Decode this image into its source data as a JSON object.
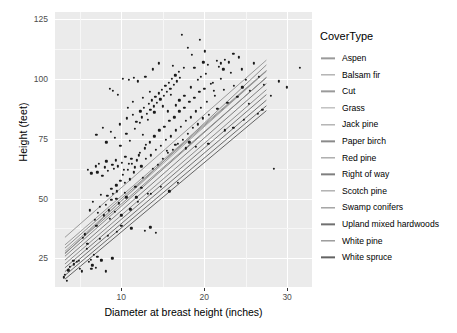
{
  "chart_data": {
    "type": "scatter",
    "title": "",
    "xlabel": "Diameter at breast height (inches)",
    "ylabel": "Height (feet)",
    "xlim": [
      2,
      33
    ],
    "ylim": [
      13,
      128
    ],
    "xticks": [
      10,
      20,
      30
    ],
    "xtick_labels": [
      "10",
      "20",
      "30"
    ],
    "yticks": [
      25,
      50,
      75,
      100,
      125
    ],
    "ytick_labels": [
      "25",
      "50",
      "75",
      "100",
      "125"
    ],
    "grid": true,
    "grid_major_color": "#ffffff",
    "grid_minor_color": "#f7f7f7",
    "panel_background": "#ebebeb",
    "legend_position": "right",
    "legend_title": "CoverType",
    "point_color": "#1a1a1a",
    "series": [
      {
        "name": "Aspen",
        "key_color": "#9a9a9a",
        "fit": {
          "intercept": 24.0,
          "slope": 3.05
        }
      },
      {
        "name": "Balsam fir",
        "key_color": "#8f8f8f",
        "fit": {
          "intercept": 16.5,
          "slope": 3.25
        }
      },
      {
        "name": "Cut",
        "key_color": "#9a9a9a",
        "fit": {
          "intercept": 21.0,
          "slope": 3.0
        }
      },
      {
        "name": "Grass",
        "key_color": "#a3a3a3",
        "fit": {
          "intercept": 18.0,
          "slope": 3.1
        }
      },
      {
        "name": "Jack pine",
        "key_color": "#909090",
        "fit": {
          "intercept": 19.5,
          "slope": 3.05
        }
      },
      {
        "name": "Paper birch",
        "key_color": "#8a8a8a",
        "fit": {
          "intercept": 17.5,
          "slope": 3.02
        }
      },
      {
        "name": "Red pine",
        "key_color": "#868686",
        "fit": {
          "intercept": 16.0,
          "slope": 3.08
        }
      },
      {
        "name": "Right of way",
        "key_color": "#7f7f7f",
        "fit": {
          "intercept": 14.5,
          "slope": 3.04
        }
      },
      {
        "name": "Scotch pine",
        "key_color": "#8c8c8c",
        "fit": {
          "intercept": 13.0,
          "slope": 3.0
        }
      },
      {
        "name": "Swamp conifers",
        "key_color": "#787878",
        "fit": {
          "intercept": 11.5,
          "slope": 2.98
        }
      },
      {
        "name": "Upland mixed hardwoods",
        "key_color": "#707070",
        "fit": {
          "intercept": 10.0,
          "slope": 2.95
        }
      },
      {
        "name": "White pine",
        "key_color": "#6b6b6b",
        "fit": {
          "intercept": 8.5,
          "slope": 2.92
        }
      },
      {
        "name": "White spruce",
        "key_color": "#636363",
        "fit": {
          "intercept": 7.0,
          "slope": 2.9
        }
      }
    ],
    "points": [
      [
        3.1,
        17.0
      ],
      [
        3.4,
        15.5
      ],
      [
        3.8,
        21.5
      ],
      [
        4.2,
        24.0
      ],
      [
        4.6,
        23.5
      ],
      [
        5.0,
        20.5
      ],
      [
        5.2,
        19.5
      ],
      [
        5.6,
        35.0
      ],
      [
        5.9,
        31.0
      ],
      [
        6.1,
        23.5
      ],
      [
        6.3,
        24.5
      ],
      [
        6.5,
        22.0
      ],
      [
        6.8,
        41.0
      ],
      [
        7.0,
        38.5
      ],
      [
        7.2,
        44.0
      ],
      [
        7.4,
        46.5
      ],
      [
        7.6,
        24.0
      ],
      [
        7.9,
        43.0
      ],
      [
        8.1,
        47.5
      ],
      [
        8.3,
        51.0
      ],
      [
        8.5,
        45.0
      ],
      [
        8.6,
        41.5
      ],
      [
        8.8,
        49.5
      ],
      [
        9.0,
        52.0
      ],
      [
        9.2,
        44.5
      ],
      [
        9.4,
        55.5
      ],
      [
        9.5,
        53.0
      ],
      [
        9.7,
        48.0
      ],
      [
        9.9,
        57.5
      ],
      [
        10.0,
        43.0
      ],
      [
        10.2,
        60.0
      ],
      [
        10.4,
        56.5
      ],
      [
        10.6,
        50.5
      ],
      [
        10.8,
        62.0
      ],
      [
        11.0,
        58.0
      ],
      [
        11.1,
        45.5
      ],
      [
        11.3,
        64.5
      ],
      [
        11.5,
        61.0
      ],
      [
        11.7,
        55.0
      ],
      [
        11.9,
        66.0
      ],
      [
        12.0,
        48.5
      ],
      [
        12.2,
        69.0
      ],
      [
        12.4,
        63.5
      ],
      [
        12.6,
        58.5
      ],
      [
        12.8,
        71.0
      ],
      [
        13.0,
        66.5
      ],
      [
        13.2,
        52.0
      ],
      [
        13.4,
        73.5
      ],
      [
        13.6,
        68.0
      ],
      [
        13.8,
        62.5
      ],
      [
        14.0,
        76.0
      ],
      [
        14.2,
        70.5
      ],
      [
        14.4,
        64.0
      ],
      [
        14.6,
        78.5
      ],
      [
        14.8,
        72.0
      ],
      [
        15.0,
        66.5
      ],
      [
        15.2,
        80.0
      ],
      [
        15.4,
        74.5
      ],
      [
        15.6,
        69.0
      ],
      [
        15.8,
        82.5
      ],
      [
        16.0,
        76.0
      ],
      [
        16.2,
        70.5
      ],
      [
        16.4,
        84.0
      ],
      [
        16.6,
        78.5
      ],
      [
        16.8,
        73.0
      ],
      [
        17.0,
        86.5
      ],
      [
        17.2,
        80.0
      ],
      [
        17.4,
        74.5
      ],
      [
        17.6,
        88.0
      ],
      [
        17.8,
        82.5
      ],
      [
        18.0,
        77.0
      ],
      [
        18.2,
        90.5
      ],
      [
        18.4,
        84.0
      ],
      [
        18.6,
        79.5
      ],
      [
        18.8,
        92.0
      ],
      [
        19.0,
        86.5
      ],
      [
        19.2,
        81.0
      ],
      [
        19.4,
        94.5
      ],
      [
        19.6,
        88.0
      ],
      [
        19.8,
        83.5
      ],
      [
        20.0,
        96.0
      ],
      [
        20.3,
        90.5
      ],
      [
        20.6,
        85.0
      ],
      [
        21.0,
        98.5
      ],
      [
        21.3,
        93.0
      ],
      [
        21.6,
        87.5
      ],
      [
        22.0,
        100.0
      ],
      [
        22.4,
        95.5
      ],
      [
        22.8,
        90.0
      ],
      [
        23.2,
        102.5
      ],
      [
        23.6,
        97.0
      ],
      [
        24.0,
        92.5
      ],
      [
        24.5,
        104.0
      ],
      [
        25.0,
        99.5
      ],
      [
        25.5,
        95.0
      ],
      [
        26.0,
        106.5
      ],
      [
        26.6,
        101.0
      ],
      [
        27.2,
        97.5
      ],
      [
        28.0,
        93.0
      ],
      [
        28.4,
        62.5
      ],
      [
        29.0,
        99.0
      ],
      [
        30.0,
        96.5
      ],
      [
        31.5,
        104.5
      ],
      [
        6.0,
        62.0
      ],
      [
        6.4,
        60.5
      ],
      [
        6.9,
        63.5
      ],
      [
        7.1,
        61.0
      ],
      [
        7.3,
        64.5
      ],
      [
        7.7,
        59.5
      ],
      [
        8.0,
        63.0
      ],
      [
        8.2,
        65.5
      ],
      [
        8.4,
        61.5
      ],
      [
        8.9,
        64.0
      ],
      [
        9.1,
        62.5
      ],
      [
        9.3,
        66.0
      ],
      [
        9.6,
        63.5
      ],
      [
        10.1,
        65.0
      ],
      [
        10.3,
        62.0
      ],
      [
        10.5,
        67.5
      ],
      [
        10.9,
        64.5
      ],
      [
        11.2,
        66.5
      ],
      [
        11.6,
        63.0
      ],
      [
        12.1,
        68.0
      ],
      [
        7.8,
        79.5
      ],
      [
        8.7,
        78.0
      ],
      [
        9.8,
        81.0
      ],
      [
        10.7,
        83.5
      ],
      [
        11.4,
        85.0
      ],
      [
        11.8,
        82.0
      ],
      [
        12.3,
        86.5
      ],
      [
        12.5,
        84.0
      ],
      [
        12.7,
        88.0
      ],
      [
        13.1,
        85.5
      ],
      [
        13.3,
        89.5
      ],
      [
        13.5,
        87.0
      ],
      [
        13.7,
        91.0
      ],
      [
        13.9,
        88.5
      ],
      [
        14.1,
        92.5
      ],
      [
        14.3,
        90.0
      ],
      [
        14.5,
        94.0
      ],
      [
        14.7,
        91.5
      ],
      [
        14.9,
        95.5
      ],
      [
        15.1,
        93.0
      ],
      [
        15.3,
        97.0
      ],
      [
        15.5,
        94.5
      ],
      [
        15.7,
        98.5
      ],
      [
        15.9,
        96.0
      ],
      [
        16.1,
        100.0
      ],
      [
        16.3,
        97.5
      ],
      [
        16.5,
        101.5
      ],
      [
        16.7,
        99.0
      ],
      [
        16.9,
        103.0
      ],
      [
        17.1,
        100.5
      ],
      [
        11.5,
        100.5
      ],
      [
        12.0,
        99.0
      ],
      [
        12.9,
        101.0
      ],
      [
        10.9,
        99.5
      ],
      [
        10.2,
        100.0
      ],
      [
        9.0,
        95.0
      ],
      [
        9.6,
        93.5
      ],
      [
        8.6,
        96.0
      ],
      [
        19.5,
        116.5
      ],
      [
        17.3,
        118.5
      ],
      [
        20.1,
        111.5
      ],
      [
        19.9,
        107.0
      ],
      [
        21.5,
        107.5
      ],
      [
        22.0,
        106.5
      ],
      [
        22.5,
        108.0
      ],
      [
        23.0,
        107.0
      ],
      [
        21.8,
        105.0
      ],
      [
        22.3,
        104.0
      ],
      [
        23.5,
        110.5
      ],
      [
        24.2,
        109.0
      ],
      [
        18.0,
        113.0
      ],
      [
        18.5,
        110.0
      ],
      [
        17.5,
        104.5
      ],
      [
        16.2,
        105.5
      ],
      [
        14.5,
        106.5
      ],
      [
        13.8,
        104.0
      ],
      [
        7.0,
        76.5
      ],
      [
        8.2,
        73.5
      ],
      [
        9.2,
        75.5
      ],
      [
        9.9,
        72.0
      ],
      [
        10.6,
        77.0
      ],
      [
        11.0,
        74.0
      ],
      [
        12.6,
        76.5
      ],
      [
        13.0,
        72.5
      ],
      [
        15.5,
        70.0
      ],
      [
        16.5,
        72.5
      ],
      [
        17.8,
        71.0
      ],
      [
        18.2,
        73.5
      ],
      [
        19.0,
        71.5
      ],
      [
        20.5,
        73.0
      ],
      [
        22.5,
        78.5
      ],
      [
        23.5,
        79.5
      ],
      [
        24.8,
        83.0
      ],
      [
        26.5,
        85.5
      ],
      [
        6.2,
        45.0
      ],
      [
        6.6,
        48.5
      ],
      [
        7.5,
        51.5
      ],
      [
        8.8,
        54.0
      ],
      [
        9.4,
        50.0
      ],
      [
        10.4,
        52.5
      ],
      [
        11.8,
        50.5
      ],
      [
        12.4,
        54.5
      ],
      [
        13.6,
        52.0
      ],
      [
        14.8,
        55.0
      ],
      [
        15.8,
        53.0
      ],
      [
        16.8,
        56.5
      ],
      [
        12.8,
        36.5
      ],
      [
        13.5,
        38.0
      ],
      [
        11.2,
        37.5
      ],
      [
        14.2,
        35.5
      ],
      [
        10.0,
        38.5
      ],
      [
        9.5,
        36.0
      ],
      [
        8.4,
        34.5
      ],
      [
        7.4,
        33.0
      ],
      [
        5.4,
        33.5
      ],
      [
        5.8,
        29.0
      ],
      [
        6.7,
        26.5
      ],
      [
        7.1,
        25.5
      ],
      [
        7.6,
        24.5
      ],
      [
        8.9,
        25.0
      ],
      [
        4.9,
        24.0
      ],
      [
        4.3,
        22.5
      ],
      [
        3.6,
        20.0
      ],
      [
        3.2,
        18.0
      ],
      [
        6.4,
        20.5
      ],
      [
        6.9,
        21.0
      ],
      [
        8.1,
        19.5
      ],
      [
        16.0,
        93.5
      ],
      [
        17.0,
        91.0
      ],
      [
        18.4,
        96.5
      ],
      [
        19.2,
        99.5
      ],
      [
        20.2,
        102.0
      ],
      [
        20.8,
        98.0
      ],
      [
        21.2,
        95.0
      ],
      [
        15.0,
        88.5
      ],
      [
        14.0,
        86.0
      ],
      [
        13.2,
        83.0
      ],
      [
        12.2,
        81.5
      ],
      [
        11.6,
        79.0
      ],
      [
        10.8,
        88.0
      ],
      [
        11.4,
        90.5
      ],
      [
        12.6,
        92.0
      ],
      [
        13.4,
        94.5
      ],
      [
        15.6,
        86.5
      ],
      [
        16.6,
        89.0
      ],
      [
        17.6,
        93.0
      ],
      [
        19.6,
        101.0
      ],
      [
        18.8,
        104.5
      ],
      [
        20.4,
        106.0
      ],
      [
        24.6,
        96.5
      ],
      [
        25.4,
        89.5
      ],
      [
        27.0,
        87.0
      ]
    ]
  }
}
